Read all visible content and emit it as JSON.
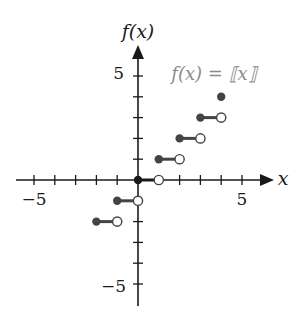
{
  "chart_data": {
    "type": "line",
    "subtype": "step",
    "function_label": "f(x) = ⟦x⟧",
    "xlabel": "x",
    "ylabel": "f(x)",
    "xlim": [
      -6,
      6.5
    ],
    "ylim": [
      -6,
      6.3
    ],
    "x_ticks": [
      -5,
      -4,
      -3,
      -2,
      -1,
      1,
      2,
      3,
      4,
      5
    ],
    "y_ticks": [
      -5,
      -4,
      -3,
      -2,
      -1,
      1,
      2,
      3,
      4,
      5
    ],
    "x_tick_labels": [
      {
        "value": -5,
        "label": "−5"
      },
      {
        "value": 5,
        "label": "5"
      }
    ],
    "y_tick_labels": [
      {
        "value": 5,
        "label": "5"
      },
      {
        "value": -5,
        "label": "−5"
      }
    ],
    "grid": false,
    "segments": [
      {
        "y": -2,
        "x_start": -2,
        "x_end": -1,
        "start": "closed",
        "end": "open"
      },
      {
        "y": -1,
        "x_start": -1,
        "x_end": 0,
        "start": "closed",
        "end": "open"
      },
      {
        "y": 0,
        "x_start": 0,
        "x_end": 1,
        "start": "closed",
        "end": "open"
      },
      {
        "y": 1,
        "x_start": 1,
        "x_end": 2,
        "start": "closed",
        "end": "open"
      },
      {
        "y": 2,
        "x_start": 2,
        "x_end": 3,
        "start": "closed",
        "end": "open"
      },
      {
        "y": 3,
        "x_start": 3,
        "x_end": 4,
        "start": "closed",
        "end": "open"
      },
      {
        "y": 4,
        "x_start": 4,
        "x_end": 4,
        "start": "closed",
        "end": "closed"
      }
    ],
    "colors": {
      "axis": "#1a1a1a",
      "segment": "#444444",
      "dot": "#444444",
      "label": "#8a8a8a"
    }
  },
  "labels": {
    "y_axis": "f(x)",
    "x_axis": "x",
    "equation": "f(x) = ⟦x⟧",
    "x_pos5": "5",
    "x_neg5": "−5",
    "y_pos5": "5",
    "y_neg5": "−5"
  }
}
